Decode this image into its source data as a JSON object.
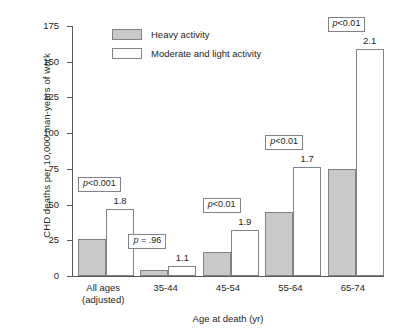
{
  "chart_data": {
    "type": "bar",
    "title": "",
    "xlabel": "Age at death (yr)",
    "ylabel": "CHD deaths per 10,000 man-years of work",
    "ylim": [
      0,
      175
    ],
    "yticks": [
      0,
      25,
      50,
      75,
      100,
      125,
      150,
      175
    ],
    "grid": false,
    "legend_position": "top-left-inside",
    "categories": [
      "All ages (adjusted)",
      "35-44",
      "45-54",
      "55-64",
      "65-74"
    ],
    "category_lines": [
      [
        "All ages",
        "(adjusted)"
      ],
      [
        "35-44"
      ],
      [
        "45-54"
      ],
      [
        "55-64"
      ],
      [
        "65-74"
      ]
    ],
    "series": [
      {
        "name": "Heavy activity",
        "color": "#c9c9c9",
        "values": [
          26,
          4,
          17,
          45,
          75
        ]
      },
      {
        "name": "Moderate and light activity",
        "color": "#ffffff",
        "values": [
          47,
          7,
          32,
          76,
          159
        ]
      }
    ],
    "annotations": {
      "rate_ratios": [
        "1.8",
        "1.1",
        "1.9",
        "1.7",
        "2.1"
      ],
      "p_values": [
        "p<0.001",
        "p = .96",
        "p<0.01",
        "p<0.01",
        "p<0.01"
      ],
      "p_value_parts": [
        {
          "p": "p",
          "rest": "<0.001"
        },
        {
          "p": "p",
          "rest": " = .96"
        },
        {
          "p": "p",
          "rest": "<0.01"
        },
        {
          "p": "p",
          "rest": "<0.01"
        },
        {
          "p": "p",
          "rest": "<0.01"
        }
      ]
    }
  },
  "axis": {
    "y_title": "CHD deaths per 10,000 man-years of work",
    "x_title": "Age at death (yr)",
    "ticks": [
      "175",
      "150",
      "125",
      "100",
      "75",
      "50",
      "25",
      "0"
    ]
  },
  "legend": {
    "items": [
      {
        "label": "Heavy activity"
      },
      {
        "label": "Moderate and light activity"
      }
    ]
  },
  "groups": [
    {
      "label_line1": "All ages",
      "label_line2": "(adjusted)",
      "heavy": 26,
      "moderate": 47,
      "ratio": "1.8",
      "p_italic": "p",
      "p_rest": "<0.001"
    },
    {
      "label_line1": "35-44",
      "label_line2": "",
      "heavy": 4,
      "moderate": 7,
      "ratio": "1.1",
      "p_italic": "p",
      "p_rest": " = .96"
    },
    {
      "label_line1": "45-54",
      "label_line2": "",
      "heavy": 17,
      "moderate": 32,
      "ratio": "1.9",
      "p_italic": "p",
      "p_rest": "<0.01"
    },
    {
      "label_line1": "55-64",
      "label_line2": "",
      "heavy": 45,
      "moderate": 76,
      "ratio": "1.7",
      "p_italic": "p",
      "p_rest": "<0.01"
    },
    {
      "label_line1": "65-74",
      "label_line2": "",
      "heavy": 75,
      "moderate": 159,
      "ratio": "2.1",
      "p_italic": "p",
      "p_rest": "<0.01"
    }
  ]
}
